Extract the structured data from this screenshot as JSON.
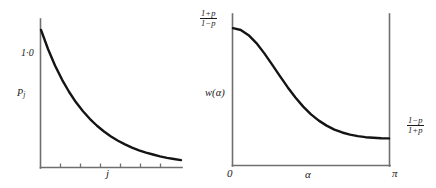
{
  "figure": {
    "background_color": "#ffffff",
    "ink_color": "#141414",
    "axis_color": "#6f6f6f",
    "width": 436,
    "height": 188
  },
  "left_panel": {
    "name": "exponential-decay-plot",
    "ymax_label": "1·0",
    "yaxis_label_main": "P",
    "yaxis_label_sub": "j",
    "xaxis_label": "j"
  },
  "right_panel": {
    "name": "spectral-density-plot",
    "ymax_numerator": "1+p",
    "ymax_denominator": "1−p",
    "ymin_numerator": "1−p",
    "ymin_denominator": "1+p",
    "yaxis_label": "w(α)",
    "x_start_label": "0",
    "x_mid_label": "α",
    "x_end_label": "π"
  },
  "chart_data": [
    {
      "type": "line",
      "name": "left-exponential-decay",
      "title": "",
      "xlabel": "j",
      "ylabel": "P_j",
      "xlim": [
        0,
        10
      ],
      "ylim": [
        0,
        1.08
      ],
      "grid": false,
      "legend": null,
      "annotations": [
        {
          "text": "1·0",
          "x": 0,
          "y": 1.0,
          "position": "left-of-axis"
        }
      ],
      "xtick_labels": [
        "",
        "",
        "",
        "",
        "",
        "",
        ""
      ],
      "ytick_labels": [
        "1·0"
      ],
      "description": "Monotone exponential decay from 1.0 at j=0 asymptoting to 0",
      "x": [
        0,
        0.5,
        1,
        1.5,
        2,
        2.5,
        3,
        3.5,
        4,
        4.5,
        5,
        5.5,
        6,
        6.5,
        7,
        7.5,
        8,
        8.5,
        9,
        9.5,
        10
      ],
      "y": [
        1.0,
        0.861,
        0.741,
        0.638,
        0.549,
        0.472,
        0.407,
        0.35,
        0.301,
        0.259,
        0.223,
        0.192,
        0.165,
        0.142,
        0.122,
        0.105,
        0.091,
        0.078,
        0.067,
        0.058,
        0.05
      ]
    },
    {
      "type": "line",
      "name": "right-spectral-density",
      "title": "",
      "xlabel": "α",
      "ylabel": "w(α)",
      "xlim": [
        0,
        3.14159
      ],
      "ylim": [
        0,
        1.0
      ],
      "grid": false,
      "legend": null,
      "annotations": [
        {
          "text": "(1+p)/(1−p)",
          "x": 0,
          "y": 0.9,
          "position": "left-of-axis"
        },
        {
          "text": "(1−p)/(1+p)",
          "x": 3.14159,
          "y": 0.175,
          "position": "right-of-axis"
        }
      ],
      "xtick_labels": [
        "0",
        "α",
        "π"
      ],
      "ytick_labels": [
        "(1+p)/(1−p)",
        "(1−p)/(1+p)"
      ],
      "description": "Spectral density decreasing monotonically from (1+p)/(1-p) at alpha=0 to (1-p)/(1+p) at alpha=pi",
      "x": [
        0.0,
        0.157,
        0.314,
        0.471,
        0.628,
        0.785,
        0.942,
        1.1,
        1.257,
        1.414,
        1.571,
        1.728,
        1.885,
        2.042,
        2.199,
        2.356,
        2.513,
        2.67,
        2.827,
        2.985,
        3.142
      ],
      "y": [
        0.9,
        0.888,
        0.854,
        0.802,
        0.736,
        0.662,
        0.586,
        0.512,
        0.444,
        0.384,
        0.333,
        0.292,
        0.259,
        0.233,
        0.214,
        0.2,
        0.19,
        0.183,
        0.179,
        0.176,
        0.175
      ]
    }
  ]
}
